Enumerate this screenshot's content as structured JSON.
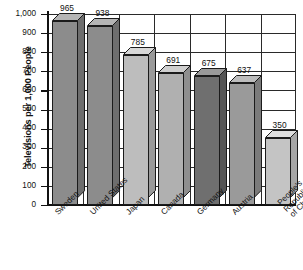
{
  "chart_data": {
    "type": "bar",
    "title": "",
    "subtitle": "",
    "xlabel": "",
    "ylabel": "Televisions per 1,000 People",
    "categories": [
      "Sweden",
      "United States",
      "Japan",
      "Canada",
      "Germany",
      "Austria",
      "People's Republic of China"
    ],
    "category_lines": [
      [
        "Sweden"
      ],
      [
        "United States"
      ],
      [
        "Japan"
      ],
      [
        "Canada"
      ],
      [
        "Germany"
      ],
      [
        "Austria"
      ],
      [
        "People's",
        "Republic",
        "of China"
      ]
    ],
    "values": [
      965,
      938,
      785,
      691,
      675,
      637,
      350
    ],
    "value_labels": [
      "965",
      "938",
      "785",
      "691",
      "675",
      "637",
      "350"
    ],
    "ylim": [
      0,
      1000
    ],
    "ytick_values": [
      1000,
      900,
      800,
      700,
      600,
      500,
      400,
      300,
      200,
      100,
      0
    ],
    "ytick_labels": [
      "1,000",
      "900",
      "800",
      "700",
      "600",
      "500",
      "400",
      "300",
      "200",
      "100",
      "0"
    ],
    "grid": "horizontal-and-vertical",
    "legend": "none",
    "style": "3d-bar",
    "bar_colors": [
      "#8c8c8c",
      "#8c8c8c",
      "#bdbdbd",
      "#b0b0b0",
      "#6f6f6f",
      "#9a9a9a",
      "#c4c4c4"
    ],
    "bar_top_colors": [
      "#b5b5b5",
      "#b5b5b5",
      "#d8d8d8",
      "#cfcfcf",
      "#9a9a9a",
      "#bdbdbd",
      "#dedede"
    ],
    "bar_side_colors": [
      "#6e6e6e",
      "#6e6e6e",
      "#9a9a9a",
      "#8e8e8e",
      "#555555",
      "#7b7b7b",
      "#a6a6a6"
    ],
    "axis_color": "#111111",
    "grid_color": "#2a2a2a",
    "background": "#ffffff"
  }
}
